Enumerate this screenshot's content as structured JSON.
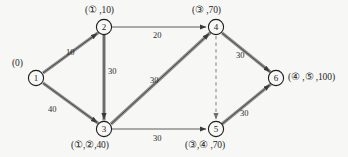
{
  "diagram": {
    "background_color": "#f7f7f5",
    "ink_color": "#2b2b2b",
    "nodes": [
      {
        "id": "1",
        "x": 36,
        "y": 78,
        "label": "(0)",
        "label_x": 12,
        "label_y": 60
      },
      {
        "id": "2",
        "x": 104,
        "y": 27,
        "label": "(① ,10)",
        "label_x": 86,
        "label_y": 4
      },
      {
        "id": "3",
        "x": 104,
        "y": 129,
        "label": "(①,②,40)",
        "label_x": 74,
        "label_y": 140
      },
      {
        "id": "4",
        "x": 216,
        "y": 27,
        "label": "(③ ,70)",
        "label_x": 190,
        "label_y": 4
      },
      {
        "id": "5",
        "x": 216,
        "y": 129,
        "label": "(③,④ ,70)",
        "label_x": 190,
        "label_y": 140
      },
      {
        "id": "6",
        "x": 276,
        "y": 78,
        "label": "(④ ,⑤ ,100)",
        "label_x": 292,
        "label_y": 70
      }
    ],
    "edges": [
      {
        "from": "1",
        "to": "2",
        "weight": "10",
        "style": "double",
        "wx": 66,
        "wy": 47
      },
      {
        "from": "1",
        "to": "3",
        "weight": "40",
        "style": "double",
        "wx": 53,
        "wy": 106
      },
      {
        "from": "2",
        "to": "4",
        "weight": "20",
        "style": "single",
        "wx": 157,
        "wy": 27
      },
      {
        "from": "2",
        "to": "3",
        "weight": "30",
        "style": "double",
        "wx": 109,
        "wy": 72
      },
      {
        "from": "3",
        "to": "4",
        "weight": "30",
        "style": "double",
        "wx": 157,
        "wy": 80
      },
      {
        "from": "3",
        "to": "5",
        "weight": "30",
        "style": "single",
        "wx": 157,
        "wy": 137
      },
      {
        "from": "4",
        "to": "6",
        "weight": "30",
        "style": "double",
        "wx": 239,
        "wy": 55
      },
      {
        "from": "5",
        "to": "6",
        "weight": "30",
        "style": "double",
        "wx": 243,
        "wy": 112
      },
      {
        "from": "4",
        "to": "5",
        "weight": "",
        "style": "dashed",
        "wx": 0,
        "wy": 0
      }
    ]
  }
}
